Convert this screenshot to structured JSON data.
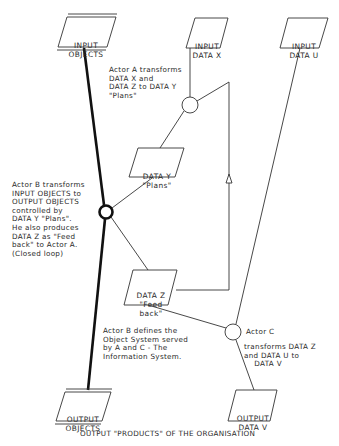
{
  "nodes": {
    "input_objects": {
      "line1": "INPUT",
      "line2": "OBJECTS"
    },
    "input_data_x": {
      "line1": "INPUT",
      "line2": "DATA X"
    },
    "input_data_u": {
      "line1": "INPUT",
      "line2": "DATA U"
    },
    "data_y": {
      "line1": "DATA Y",
      "line2": "\"Plans\""
    },
    "data_z": {
      "line1": "DATA Z",
      "line2": "\"Feed",
      "line3": "back\""
    },
    "output_objects": {
      "line1": "OUTPUT",
      "line2": "OBJECTS"
    },
    "output_data_v": {
      "line1": "OUTPUT",
      "line2": "DATA V"
    }
  },
  "actors": {
    "actor_a": {
      "description": "Actor A transforms\nDATA X and\nDATA Z to DATA Y\n\"Plans\""
    },
    "actor_b": {
      "description": "Actor B transforms\nINPUT OBJECTS to\nOUTPUT OBJECTS\ncontrolled by\nDATA Y \"Plans\".\nHe also produces\nDATA Z as \"Feed\nback\" to Actor A.\n(Closed loop)"
    },
    "actor_b_note": {
      "description": "Actor B defines the\nObject System served\nby A and C - The\nInformation System."
    },
    "actor_c": {
      "label": "Actor C",
      "description": "transforms DATA Z\nand DATA U to\n    DATA V"
    }
  },
  "caption": "OUTPUT \"PRODUCTS\" OF THE ORGANISATION",
  "colors": {
    "line": "#2b2b2b",
    "bold_line": "#111111",
    "background": "#ffffff"
  }
}
